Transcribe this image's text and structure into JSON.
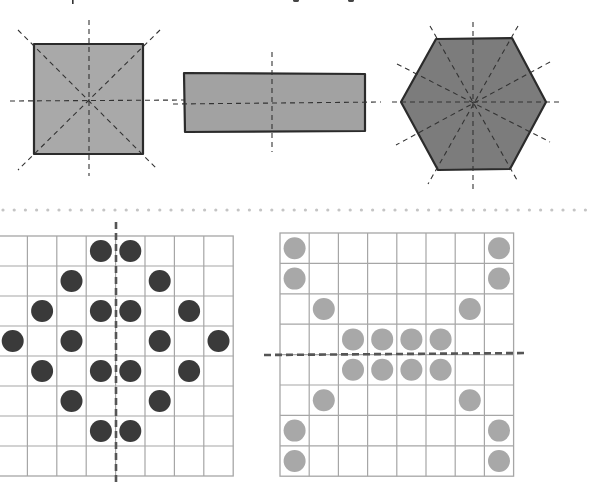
{
  "header": {
    "cropped_caption": ""
  },
  "colors": {
    "background": "#ffffff",
    "outline": "#2b2b2b",
    "square_fill": "#a9a9a9",
    "rectangle_fill": "#a2a2a2",
    "hexagon_fill": "#7c7c7c",
    "axis_dash": "#333333",
    "grid_line": "#a6a6a6",
    "dark_dot": "#3a3a3a",
    "light_dot": "#a8a8a8",
    "separator_dot": "#c4c4c4",
    "grid_axis_dash": "#555555"
  },
  "shapes": [
    {
      "name": "square",
      "points": [
        [
          34,
          44
        ],
        [
          143,
          44
        ],
        [
          143,
          154
        ],
        [
          34,
          154
        ]
      ],
      "fill_key": "square_fill",
      "symmetry_lines": [
        [
          89,
          20,
          89,
          176
        ],
        [
          10,
          101,
          186,
          100
        ],
        [
          18,
          30,
          158,
          170
        ],
        [
          160,
          30,
          18,
          170
        ]
      ]
    },
    {
      "name": "rectangle",
      "points": [
        [
          184,
          73
        ],
        [
          365,
          74
        ],
        [
          365,
          131
        ],
        [
          185,
          132
        ]
      ],
      "fill_key": "rectangle_fill",
      "symmetry_lines": [
        [
          272,
          52,
          272,
          152
        ],
        [
          173,
          104,
          381,
          102
        ]
      ]
    },
    {
      "name": "hexagon",
      "points": [
        [
          401,
          102
        ],
        [
          436,
          39
        ],
        [
          512,
          38
        ],
        [
          546,
          102
        ],
        [
          510,
          169
        ],
        [
          438,
          170
        ]
      ],
      "fill_key": "hexagon_fill",
      "symmetry_lines": [
        [
          473,
          22,
          473,
          190
        ],
        [
          392,
          102,
          560,
          102
        ],
        [
          430,
          26,
          517,
          180
        ],
        [
          518,
          26,
          428,
          184
        ],
        [
          397,
          64,
          550,
          142
        ],
        [
          550,
          62,
          396,
          145
        ]
      ]
    }
  ],
  "separator": {
    "y": 210,
    "x_start": 3,
    "x_end": 592,
    "spacing": 11.2,
    "radius": 1.6
  },
  "grids": [
    {
      "name": "left-grid",
      "x": -2,
      "y": 236,
      "cols": 8,
      "rows": 8,
      "cell_w": 29.4,
      "cell_h": 30,
      "dot_color_key": "dark_dot",
      "dot_radius": 11,
      "dots": [
        [
          0,
          3
        ],
        [
          0,
          4
        ],
        [
          1,
          2
        ],
        [
          1,
          5
        ],
        [
          2,
          1
        ],
        [
          2,
          3
        ],
        [
          2,
          4
        ],
        [
          2,
          6
        ],
        [
          3,
          0
        ],
        [
          3,
          2
        ],
        [
          3,
          5
        ],
        [
          3,
          7
        ],
        [
          4,
          1
        ],
        [
          4,
          3
        ],
        [
          4,
          4
        ],
        [
          4,
          6
        ],
        [
          5,
          2
        ],
        [
          5,
          5
        ],
        [
          6,
          3
        ],
        [
          6,
          4
        ]
      ],
      "axis": {
        "orientation": "vertical",
        "x1": 116,
        "y1": 222,
        "x2": 116,
        "y2": 485
      }
    },
    {
      "name": "right-grid",
      "x": 280,
      "y": 233,
      "cols": 8,
      "rows": 8,
      "cell_w": 29.2,
      "cell_h": 30.4,
      "dot_color_key": "light_dot",
      "dot_radius": 11,
      "dots": [
        [
          0,
          0
        ],
        [
          0,
          7
        ],
        [
          1,
          0
        ],
        [
          1,
          7
        ],
        [
          2,
          1
        ],
        [
          2,
          6
        ],
        [
          3,
          2
        ],
        [
          3,
          3
        ],
        [
          3,
          4
        ],
        [
          3,
          5
        ],
        [
          4,
          2
        ],
        [
          4,
          3
        ],
        [
          4,
          4
        ],
        [
          4,
          5
        ],
        [
          5,
          1
        ],
        [
          5,
          6
        ],
        [
          6,
          0
        ],
        [
          6,
          7
        ],
        [
          7,
          0
        ],
        [
          7,
          7
        ]
      ],
      "axis": {
        "orientation": "horizontal",
        "x1": 264,
        "y1": 355,
        "x2": 528,
        "y2": 353
      }
    }
  ]
}
